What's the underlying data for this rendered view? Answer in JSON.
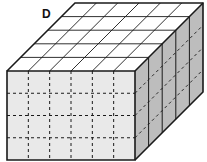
{
  "figure": {
    "label": "D",
    "front_face": {
      "columns": 6,
      "rows": 4,
      "fill": "#e9e9e9",
      "grid_style": "dashed"
    },
    "top_face": {
      "columns": 6,
      "rows": 5,
      "fill": "#ffffff",
      "grid_style": "solid"
    },
    "side_face": {
      "columns": 5,
      "rows": 4,
      "fill": "#bdbdbd",
      "grid_style": "mixed"
    },
    "dimensions": {
      "length": 6,
      "width": 5,
      "height": 4
    },
    "stroke": "#1a1a1a"
  }
}
